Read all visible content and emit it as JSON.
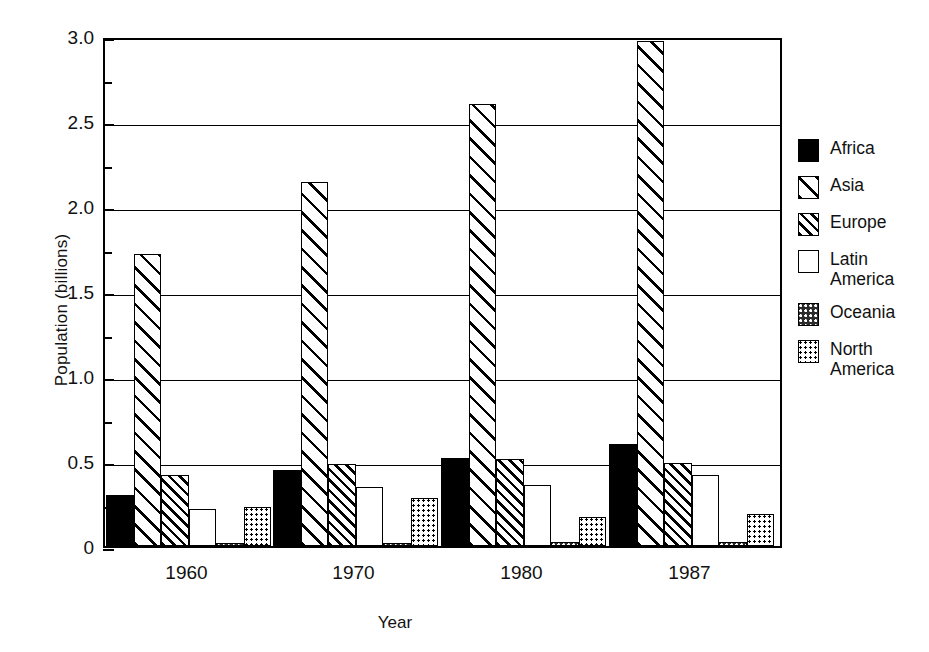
{
  "chart_data": {
    "type": "bar",
    "title": "",
    "xlabel": "Year",
    "ylabel": "Population (billions)",
    "categories": [
      "1960",
      "1970",
      "1980",
      "1987"
    ],
    "ylim": [
      0,
      3.0
    ],
    "ytick_labels": [
      "0",
      "0.5",
      "1.0",
      "1.5",
      "2.0",
      "2.5",
      "3.0"
    ],
    "ytick_values": [
      0,
      0.5,
      1.0,
      1.5,
      2.0,
      2.5,
      3.0
    ],
    "yminor_values": [
      0.25,
      0.75,
      1.25,
      1.75,
      2.25,
      2.75
    ],
    "grid": true,
    "legend_position": "right",
    "series": [
      {
        "name": "Africa",
        "pattern": "solid-black",
        "values": [
          0.3,
          0.45,
          0.52,
          0.6
        ]
      },
      {
        "name": "Asia",
        "pattern": "wide-diagonal-hatch",
        "values": [
          1.72,
          2.14,
          2.6,
          2.97
        ]
      },
      {
        "name": "Europe",
        "pattern": "dense-diagonal-hatch",
        "values": [
          0.42,
          0.48,
          0.51,
          0.49
        ]
      },
      {
        "name": "Latin\nAmerica",
        "pattern": "blank-white",
        "values": [
          0.22,
          0.35,
          0.36,
          0.42
        ]
      },
      {
        "name": "Oceania",
        "pattern": "dark-dotted",
        "values": [
          0.016,
          0.019,
          0.023,
          0.025
        ]
      },
      {
        "name": "North\nAmerica",
        "pattern": "light-dotted",
        "values": [
          0.23,
          0.28,
          0.17,
          0.19
        ]
      }
    ]
  },
  "axes": {
    "y_title": "Population (billions)",
    "x_title": "Year"
  },
  "legend": {
    "entries": [
      {
        "label": "Africa"
      },
      {
        "label": "Asia"
      },
      {
        "label": "Europe"
      },
      {
        "label": "Latin\nAmerica"
      },
      {
        "label": "Oceania"
      },
      {
        "label": "North\nAmerica"
      }
    ]
  },
  "colors": {
    "ink": "#000000",
    "paper": "#ffffff"
  }
}
